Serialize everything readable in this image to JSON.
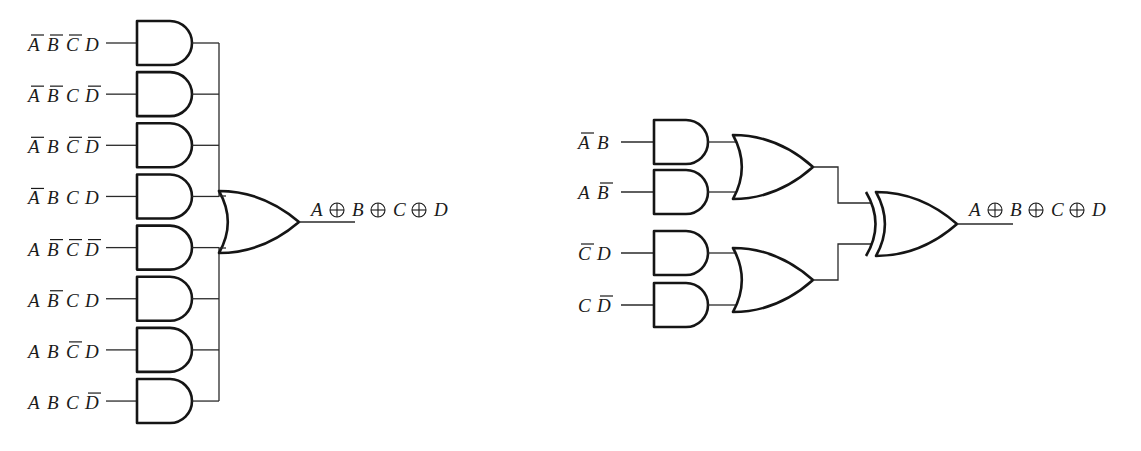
{
  "diagrams": [
    {
      "id": "sop",
      "title": "",
      "and_gates": [
        {
          "label": "ABCD",
          "bars": [
            0,
            1,
            2
          ]
        },
        {
          "label": "ABCD",
          "bars": [
            0,
            1,
            3
          ]
        },
        {
          "label": "ABCD",
          "bars": [
            0,
            2,
            3
          ]
        },
        {
          "label": "ABCD",
          "bars": [
            0
          ]
        },
        {
          "label": "ABCD",
          "bars": [
            1,
            2,
            3
          ]
        },
        {
          "label": "ABCD",
          "bars": [
            1
          ]
        },
        {
          "label": "ABCD",
          "bars": [
            2
          ]
        },
        {
          "label": "ABCD",
          "bars": [
            3
          ]
        }
      ],
      "output_gate": "OR",
      "output_label": [
        "A",
        "B",
        "C",
        "D"
      ]
    },
    {
      "id": "xor-tree",
      "title": "",
      "and_gates": [
        {
          "label": "AB",
          "bars": [
            0
          ]
        },
        {
          "label": "AB",
          "bars": [
            1
          ]
        },
        {
          "label": "CD",
          "bars": [
            0
          ]
        },
        {
          "label": "CD",
          "bars": [
            1
          ]
        }
      ],
      "or_gates": 2,
      "output_gate": "XOR",
      "output_label": [
        "A",
        "B",
        "C",
        "D"
      ]
    }
  ],
  "operator_symbol": "⊕",
  "colors": {
    "stroke": "#151515",
    "background": "#ffffff"
  }
}
